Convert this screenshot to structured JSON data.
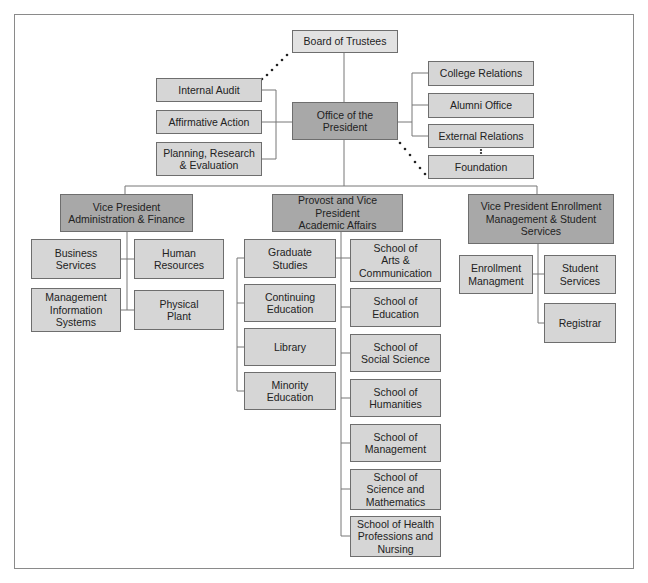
{
  "colors": {
    "box": "#d6d6d6",
    "box_dark": "#a8a8a8",
    "box_light": "#e2e2e2",
    "line": "#777777"
  },
  "nodes": {
    "board": "Board of Trustees",
    "internal_audit": "Internal Audit",
    "affirmative_action": "Affirmative Action",
    "planning": "Planning, Research\n& Evaluation",
    "president": "Office of the\nPresident",
    "college_relations": "College Relations",
    "alumni": "Alumni Office",
    "external_relations": "External Relations",
    "foundation": "Foundation",
    "vp_admin": "Vice President\nAdministration & Finance",
    "provost": "Provost and Vice President\nAcademic Affairs",
    "vp_enroll": "Vice President Enrollment\nManagement & Student\nServices",
    "business": "Business\nServices",
    "hr": "Human\nResources",
    "mis": "Management\nInformation\nSystems",
    "plant": "Physical\nPlant",
    "graduate": "Graduate\nStudies",
    "continuing": "Continuing\nEducation",
    "library": "Library",
    "minority": "Minority\nEducation",
    "arts": "School of\nArts &\nCommunication",
    "education": "School of\nEducation",
    "social": "School of\nSocial Science",
    "humanities": "School of\nHumanities",
    "management": "School of\nManagement",
    "science": "School of\nScience and\nMathematics",
    "health": "School of Health\nProfessions and\nNursing",
    "enroll_mgmt": "Enrollment\nManagment",
    "student_services": "Student\nServices",
    "registrar": "Registrar"
  }
}
